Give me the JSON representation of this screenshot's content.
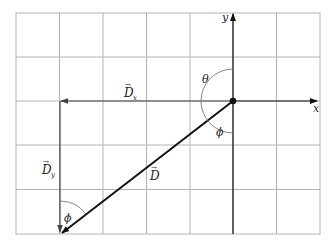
{
  "diagram": {
    "type": "vector-components",
    "grid": {
      "columns": 7,
      "rows": 5,
      "left": 16,
      "top": 13,
      "right": 320,
      "bottom": 234,
      "line_color": "#b0b0b0"
    },
    "axes": {
      "origin": [
        233,
        101
      ],
      "x_label": "x",
      "y_label": "y",
      "color": "#111111"
    },
    "vectors": [
      {
        "name": "D",
        "label": "D",
        "subscript": "",
        "from": [
          233,
          101
        ],
        "to": [
          61,
          234
        ],
        "color": "#111111"
      },
      {
        "name": "Dx",
        "label": "D",
        "subscript": "x",
        "from": [
          233,
          101
        ],
        "to": [
          60,
          101
        ],
        "color": "#555555"
      },
      {
        "name": "Dy",
        "label": "D",
        "subscript": "y",
        "from": [
          60,
          101
        ],
        "to": [
          60,
          234
        ],
        "color": "#555555"
      }
    ],
    "angles": [
      {
        "name": "theta",
        "label": "θ"
      },
      {
        "name": "phi-origin",
        "label": "ϕ"
      },
      {
        "name": "phi-tail",
        "label": "ϕ"
      }
    ],
    "labels": {
      "x_axis": "x",
      "y_axis": "y",
      "vec_D": "D",
      "vec_Dx": "D",
      "vec_Dx_sub": "x",
      "vec_Dy": "D",
      "vec_Dy_sub": "y",
      "theta": "θ",
      "phi": "ϕ",
      "arrow_over": "→"
    }
  }
}
